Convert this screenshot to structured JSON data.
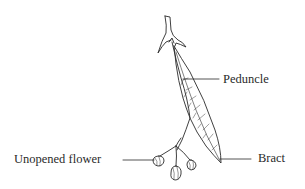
{
  "diagram": {
    "style": "black-and-white line drawing",
    "line_color": "#2a2a2a",
    "background": "#ffffff",
    "labels": [
      {
        "id": "peduncle",
        "text": "Peduncle",
        "side": "right"
      },
      {
        "id": "unopened",
        "text": "Unopened flower",
        "side": "left"
      },
      {
        "id": "bract",
        "text": "Bract",
        "side": "right"
      }
    ]
  }
}
